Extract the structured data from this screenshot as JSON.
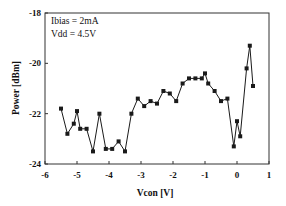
{
  "chart_data": {
    "type": "line",
    "title": "",
    "xlabel": "Vcon [V]",
    "ylabel": "Power [dBm]",
    "xlim": [
      -6,
      1
    ],
    "ylim": [
      -24,
      -18
    ],
    "xticks": [
      -6,
      -5,
      -4,
      -3,
      -2,
      -1,
      0,
      1
    ],
    "yticks": [
      -18,
      -20,
      -22,
      -24
    ],
    "grid": false,
    "legend": null,
    "annotations": [
      "Ibias = 2mA",
      "Vdd = 4.5V"
    ],
    "series": [
      {
        "name": "Power",
        "marker": "square",
        "color": "#1a1a1a",
        "x": [
          -5.5,
          -5.3,
          -5.1,
          -5.0,
          -4.9,
          -4.7,
          -4.5,
          -4.3,
          -4.1,
          -3.9,
          -3.7,
          -3.5,
          -3.3,
          -3.1,
          -2.9,
          -2.7,
          -2.5,
          -2.3,
          -2.1,
          -1.9,
          -1.7,
          -1.5,
          -1.3,
          -1.1,
          -1.0,
          -0.9,
          -0.7,
          -0.5,
          -0.3,
          -0.1,
          0.0,
          0.1,
          0.3,
          0.4,
          0.5
        ],
        "y": [
          -21.8,
          -22.8,
          -22.4,
          -21.9,
          -22.6,
          -22.6,
          -23.5,
          -22.0,
          -23.4,
          -23.4,
          -23.1,
          -23.5,
          -22.0,
          -21.4,
          -21.7,
          -21.5,
          -21.6,
          -21.1,
          -21.2,
          -21.5,
          -20.8,
          -20.6,
          -20.6,
          -20.6,
          -20.4,
          -20.8,
          -21.1,
          -21.5,
          -21.4,
          -23.3,
          -22.3,
          -22.9,
          -20.2,
          -19.3,
          -20.9
        ]
      }
    ]
  },
  "labels": {
    "xlabel": "Vcon [V]",
    "ylabel": "Power [dBm]",
    "annotation_line1": "Ibias = 2mA",
    "annotation_line2": "Vdd = 4.5V",
    "xtick_labels": [
      "-6",
      "-5",
      "-4",
      "-3",
      "-2",
      "-1",
      "0",
      "1"
    ],
    "ytick_labels": [
      "-18",
      "-20",
      "-22",
      "-24"
    ]
  }
}
